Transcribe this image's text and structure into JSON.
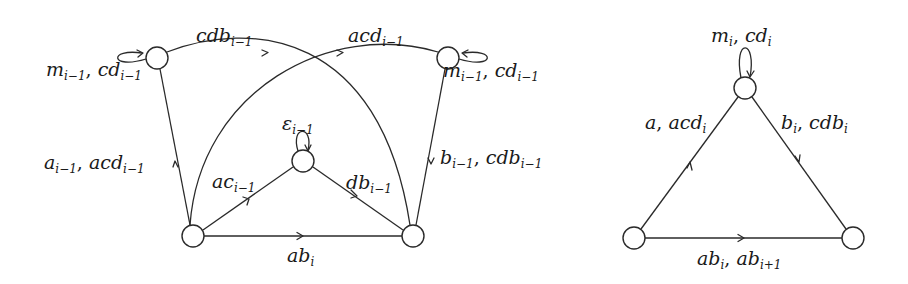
{
  "diagram_left": {
    "nodes": [
      {
        "id": "top-left",
        "x": 157,
        "y": 58,
        "r": 11,
        "self_loop": true
      },
      {
        "id": "top-right",
        "x": 448,
        "y": 58,
        "r": 11,
        "self_loop": true
      },
      {
        "id": "center",
        "x": 303,
        "y": 161,
        "r": 11,
        "self_loop": true
      },
      {
        "id": "bottom-left",
        "x": 193,
        "y": 236,
        "r": 11,
        "self_loop": false
      },
      {
        "id": "bottom-right",
        "x": 413,
        "y": 236,
        "r": 11,
        "self_loop": false
      }
    ],
    "labels": {
      "loop_top_left": {
        "base": "m",
        "sub": "i−1",
        "base2": "cd",
        "sub2": "i−1"
      },
      "loop_top_right": {
        "base": "m",
        "sub": "i−1",
        "base2": "cd",
        "sub2": "i−1"
      },
      "loop_center": {
        "base": "ε",
        "sub": "i−1"
      },
      "edge_top_left_arc": {
        "base": "cdb",
        "sub": "i−1"
      },
      "edge_top_right_arc": {
        "base": "acd",
        "sub": "i−1"
      },
      "edge_left_vertical": {
        "base": "a",
        "sub": "i−1",
        "base2": "acd",
        "sub2": "i−1"
      },
      "edge_right_vertical": {
        "base": "b",
        "sub": "i−1",
        "base2": "cdb",
        "sub2": "i−1"
      },
      "edge_to_center": {
        "base": "ac",
        "sub": "i−1"
      },
      "edge_from_center": {
        "base": "db",
        "sub": "i−1"
      },
      "edge_bottom": {
        "base": "ab",
        "sub": "i"
      }
    }
  },
  "diagram_right": {
    "nodes": [
      {
        "id": "top",
        "x": 745,
        "y": 88,
        "r": 11,
        "self_loop": true
      },
      {
        "id": "bottom-left",
        "x": 634,
        "y": 238,
        "r": 11,
        "self_loop": false
      },
      {
        "id": "bottom-right",
        "x": 853,
        "y": 238,
        "r": 11,
        "self_loop": false
      }
    ],
    "labels": {
      "loop_top": {
        "base": "m",
        "sub": "i",
        "base2": "cd",
        "sub2": "i"
      },
      "edge_left": {
        "base": "a",
        "sub": "",
        "base2": "acd",
        "sub2": "i"
      },
      "edge_right": {
        "base": "b",
        "sub": "i",
        "base2": "cdb",
        "sub2": "i"
      },
      "edge_bottom": {
        "base": "ab",
        "sub": "i",
        "base2": "ab",
        "sub2": "i+1"
      }
    }
  },
  "separator": ", "
}
